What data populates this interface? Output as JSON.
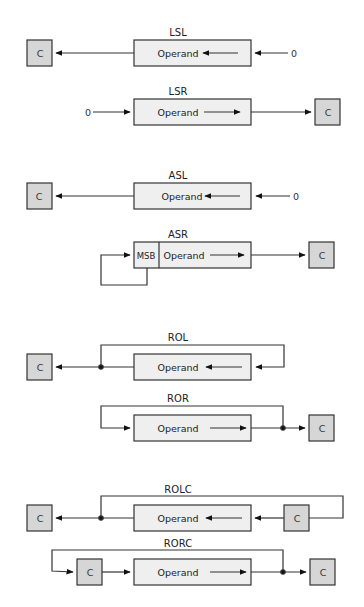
{
  "diagram": {
    "operand_label": "Operand",
    "carry_label": "C",
    "msb_label": "MSB",
    "zero_label": "0",
    "colors": {
      "operand_fill": "#efefef",
      "carry_fill": "#d6d6d6",
      "stroke": "#333333"
    },
    "operations": [
      {
        "id": "lsl",
        "label": "LSL"
      },
      {
        "id": "lsr",
        "label": "LSR"
      },
      {
        "id": "asl",
        "label": "ASL"
      },
      {
        "id": "asr",
        "label": "ASR"
      },
      {
        "id": "rol",
        "label": "ROL"
      },
      {
        "id": "ror",
        "label": "ROR"
      },
      {
        "id": "rolc",
        "label": "ROLC"
      },
      {
        "id": "rorc",
        "label": "RORC"
      }
    ]
  }
}
